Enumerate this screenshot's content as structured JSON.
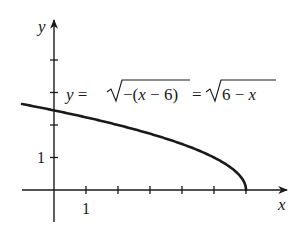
{
  "chart_data": {
    "type": "line",
    "title": "",
    "xlabel": "x",
    "ylabel": "y",
    "annotation": "y = √−(x − 6) = √6 − x",
    "annotation_parts": {
      "lhs": "y = ",
      "rad1": "−(x − 6)",
      "eq": " = ",
      "rad2": "6 − x"
    },
    "function": "sqrt(6 - x)",
    "domain_shown": [
      -1,
      6
    ],
    "xlim": [
      -1.2,
      7.5
    ],
    "ylim": [
      -1.4,
      5.2
    ],
    "x_ticks": [
      1,
      2,
      3,
      4,
      5,
      6
    ],
    "y_ticks": [
      1,
      2,
      3,
      4
    ],
    "x_tick_labels": [
      {
        "value": 1,
        "label": "1"
      }
    ],
    "y_tick_labels": [
      {
        "value": 1,
        "label": "1"
      }
    ],
    "grid": false,
    "legend": null,
    "series": [
      {
        "name": "y = sqrt(6 - x)",
        "x": [
          -1,
          0,
          1,
          2,
          3,
          4,
          5,
          5.5,
          5.9,
          6
        ],
        "values": [
          2.646,
          2.449,
          2.236,
          2.0,
          1.732,
          1.414,
          1.0,
          0.707,
          0.316,
          0
        ]
      }
    ],
    "colors": {
      "axis": "#1a1a1a",
      "curve": "#1a1a1a",
      "background": "#ffffff"
    }
  }
}
